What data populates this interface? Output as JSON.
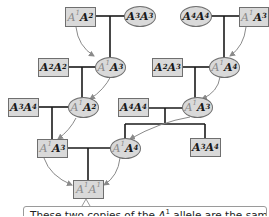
{
  "diagram": {
    "type": "pedigree",
    "colors": {
      "node_fill": "#d9d9d9",
      "node_border": "#6f6f6f",
      "line": "#1a1a1a",
      "arrow": "#8a8a8a",
      "highlight_allele": "#8a8a8a"
    },
    "nodes": [
      {
        "id": "g1-a-male",
        "shape": "square",
        "allele1": "A",
        "sup1": "1",
        "allele2": "A",
        "sup2": "2",
        "label": "A1A2"
      },
      {
        "id": "g1-a-female",
        "shape": "oval",
        "allele1": "A",
        "sup1": "3",
        "allele2": "A",
        "sup2": "3",
        "label": "A3A3"
      },
      {
        "id": "g1-b-female",
        "shape": "oval",
        "allele1": "A",
        "sup1": "4",
        "allele2": "A",
        "sup2": "4",
        "label": "A4A4"
      },
      {
        "id": "g1-b-male",
        "shape": "square",
        "allele1": "A",
        "sup1": "1",
        "allele2": "A",
        "sup2": "3",
        "label": "A1A3"
      },
      {
        "id": "g2-a-male",
        "shape": "square",
        "allele1": "A",
        "sup1": "2",
        "allele2": "A",
        "sup2": "2",
        "label": "A2A2"
      },
      {
        "id": "g2-a-female",
        "shape": "oval",
        "allele1": "A",
        "sup1": "1",
        "allele2": "A",
        "sup2": "3",
        "label": "A1A3"
      },
      {
        "id": "g2-b-male",
        "shape": "square",
        "allele1": "A",
        "sup1": "2",
        "allele2": "A",
        "sup2": "3",
        "label": "A2A3"
      },
      {
        "id": "g2-b-female",
        "shape": "oval",
        "allele1": "A",
        "sup1": "1",
        "allele2": "A",
        "sup2": "4",
        "label": "A1A4"
      },
      {
        "id": "g3-a-male",
        "shape": "square",
        "allele1": "A",
        "sup1": "3",
        "allele2": "A",
        "sup2": "4",
        "label": "A3A4"
      },
      {
        "id": "g3-a-female",
        "shape": "oval",
        "allele1": "A",
        "sup1": "1",
        "allele2": "A",
        "sup2": "2",
        "label": "A1A2"
      },
      {
        "id": "g3-b-male",
        "shape": "square",
        "allele1": "A",
        "sup1": "4",
        "allele2": "A",
        "sup2": "4",
        "label": "A4A4"
      },
      {
        "id": "g3-b-female",
        "shape": "oval",
        "allele1": "A",
        "sup1": "1",
        "allele2": "A",
        "sup2": "3",
        "label": "A1A3"
      },
      {
        "id": "g4-a-male",
        "shape": "square",
        "allele1": "A",
        "sup1": "1",
        "allele2": "A",
        "sup2": "3",
        "label": "A1A3"
      },
      {
        "id": "g4-b-female",
        "shape": "oval",
        "allele1": "A",
        "sup1": "1",
        "allele2": "A",
        "sup2": "4",
        "label": "A1A4"
      },
      {
        "id": "g4-b-male-sibling",
        "shape": "square",
        "allele1": "A",
        "sup1": "3",
        "allele2": "A",
        "sup2": "4",
        "label": "A3A4"
      },
      {
        "id": "g5-offspring",
        "shape": "square",
        "allele1": "A",
        "sup1": "1",
        "allele2": "A",
        "sup2": "1",
        "label": "A1A1"
      }
    ],
    "caption": {
      "text_before": "These two copies of the ",
      "allele": "A",
      "allele_sup": "1",
      "text_after": " allele are the same"
    }
  }
}
